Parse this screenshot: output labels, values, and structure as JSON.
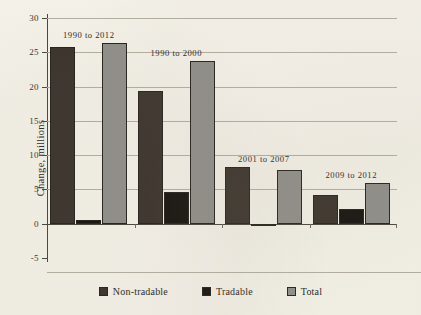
{
  "chart_data": {
    "type": "bar",
    "title": "",
    "xlabel": "",
    "ylabel": "Change, millions",
    "ylim": [
      -5,
      30
    ],
    "yticks": [
      -5,
      0,
      5,
      10,
      15,
      20,
      25,
      30
    ],
    "ytick_labels": [
      "-5",
      "0",
      "5",
      "10",
      "15",
      "20",
      "25",
      "30"
    ],
    "grid": true,
    "legend_position": "bottom",
    "categories": [
      "1990 to 2012",
      "1990 to 2000",
      "2001 to 2007",
      "2009 to 2012"
    ],
    "series": [
      {
        "name": "Non-tradable",
        "color": "#3a332c",
        "values": [
          25.8,
          19.3,
          8.3,
          4.2
        ]
      },
      {
        "name": "Tradable",
        "color": "#15120f",
        "values": [
          0.5,
          4.6,
          -0.3,
          2.1
        ]
      },
      {
        "name": "Total",
        "color": "#8f8e8a",
        "values": [
          26.3,
          23.8,
          7.8,
          6.0
        ]
      }
    ],
    "annotations": [
      {
        "text": "1990 to 2012",
        "group": 0
      },
      {
        "text": "1990 to 2000",
        "group": 1
      },
      {
        "text": "2001 to 2007",
        "group": 2
      },
      {
        "text": "2009 to 2012",
        "group": 3
      }
    ]
  },
  "axis": {
    "y_title": "Change, millions"
  },
  "legend": {
    "items": [
      {
        "label": "Non-tradable",
        "color": "#3a332c"
      },
      {
        "label": "Tradable",
        "color": "#15120f"
      },
      {
        "label": "Total",
        "color": "#8f8e8a"
      }
    ]
  }
}
